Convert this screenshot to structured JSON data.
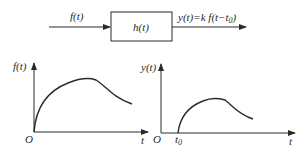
{
  "block_diagram": {
    "input_label": "f(t)",
    "block_label": "h(t)",
    "output_label_main": "y(t)=k f(t−t",
    "output_label_sub": "0",
    "output_label_close": ")"
  },
  "plot_left": {
    "y_label": "f(t)",
    "x_label": "t",
    "origin_label": "O"
  },
  "plot_right": {
    "y_label": "y(t)",
    "x_label": "t",
    "origin_label": "O",
    "delay_label_main": "t",
    "delay_label_sub": "0"
  },
  "colors": {
    "stroke": "#2a2a2a",
    "background": "#ffffff"
  }
}
